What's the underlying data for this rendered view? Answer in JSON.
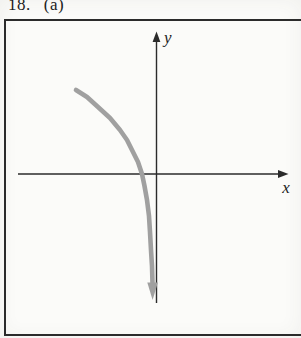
{
  "figure": {
    "exercise_number": "18.",
    "part_label": "(a)",
    "axis_labels": {
      "x": "x",
      "y": "y"
    }
  },
  "colors": {
    "paper": "#fbfbf9",
    "ink": "#2b2b2b",
    "curve": "#a0a0a0"
  },
  "chart_data": {
    "type": "line",
    "title": "",
    "xlabel": "x",
    "ylabel": "y",
    "legend": "none",
    "grid": false,
    "tick_labels": "none (qualitative sketch, unlabeled axes with arrowheads)",
    "x_intercept_px": 142,
    "y_axis_is_vertical_asymptote": true,
    "axes_px": {
      "y_axis": {
        "x": 156.5,
        "top": 41,
        "bottom": 303,
        "arrow_tip_y": 31.5
      },
      "x_axis": {
        "y": 174,
        "left": 18,
        "right": 280,
        "arrow_tip_x": 288.5
      }
    },
    "curve_points_px": [
      [
        76,
        90
      ],
      [
        87,
        97
      ],
      [
        98,
        107
      ],
      [
        110,
        118
      ],
      [
        120,
        130
      ],
      [
        127,
        140
      ],
      [
        133,
        152
      ],
      [
        138,
        162
      ],
      [
        142,
        174
      ],
      [
        144.5,
        186
      ],
      [
        147,
        200
      ],
      [
        149,
        216
      ],
      [
        150,
        232
      ],
      [
        151,
        250
      ],
      [
        152,
        266
      ],
      [
        152.5,
        283
      ]
    ],
    "curve_arrow_tip_px": [
      152.6,
      300
    ]
  }
}
